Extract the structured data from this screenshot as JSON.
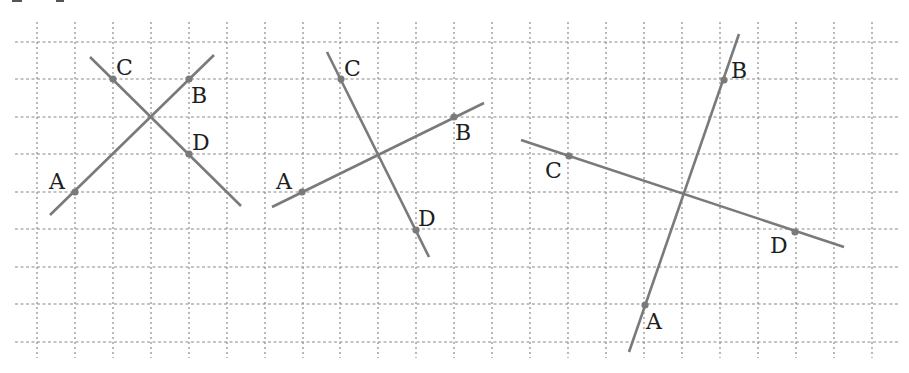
{
  "diagram": {
    "type": "geometry-grid-figures",
    "colors": {
      "background": "#ffffff",
      "grid": "#8a8a8a",
      "lines": "#7a7a7a",
      "labels": "#1e1e1e"
    },
    "grid": {
      "vertical_x": [
        37,
        75,
        113,
        151,
        189,
        227,
        265,
        303,
        340,
        378,
        416,
        454,
        492,
        530,
        568,
        606,
        644,
        682,
        720,
        758,
        796,
        834,
        872
      ],
      "horizontal_y": [
        42,
        79,
        117,
        154,
        192,
        229,
        267,
        304,
        342
      ],
      "x_extent": [
        15,
        898
      ],
      "y_extent": [
        22,
        358
      ]
    },
    "figures": [
      {
        "id": "figure-1",
        "lines": [
          {
            "name": "AB",
            "from": [
              50,
              215
            ],
            "to": [
              214,
              55
            ]
          },
          {
            "name": "CD",
            "from": [
              90,
              57
            ],
            "to": [
              241,
              206
            ]
          }
        ],
        "points": [
          {
            "label": "A",
            "x": 75,
            "y": 192,
            "lx": 49,
            "ly": 189
          },
          {
            "label": "B",
            "x": 189,
            "y": 79,
            "lx": 191,
            "ly": 103
          },
          {
            "label": "C",
            "x": 113,
            "y": 79,
            "lx": 116,
            "ly": 75
          },
          {
            "label": "D",
            "x": 189,
            "y": 154,
            "lx": 192,
            "ly": 150
          }
        ]
      },
      {
        "id": "figure-2",
        "lines": [
          {
            "name": "AB",
            "from": [
              272,
              207
            ],
            "to": [
              484,
              103
            ]
          },
          {
            "name": "CD",
            "from": [
              327,
              52
            ],
            "to": [
              429,
              257
            ]
          }
        ],
        "points": [
          {
            "label": "A",
            "x": 302,
            "y": 192,
            "lx": 276,
            "ly": 189
          },
          {
            "label": "B",
            "x": 454,
            "y": 117,
            "lx": 455,
            "ly": 140
          },
          {
            "label": "C",
            "x": 341,
            "y": 79,
            "lx": 344,
            "ly": 76
          },
          {
            "label": "D",
            "x": 416,
            "y": 230,
            "lx": 418,
            "ly": 226
          }
        ]
      },
      {
        "id": "figure-3",
        "lines": [
          {
            "name": "AB",
            "from": [
              629,
              352
            ],
            "to": [
              739,
              34
            ]
          },
          {
            "name": "CD",
            "from": [
              521,
              140
            ],
            "to": [
              844,
              247
            ]
          }
        ],
        "points": [
          {
            "label": "A",
            "x": 645,
            "y": 305,
            "lx": 646,
            "ly": 329
          },
          {
            "label": "B",
            "x": 724,
            "y": 80,
            "lx": 731,
            "ly": 78
          },
          {
            "label": "C",
            "x": 569,
            "y": 156,
            "lx": 545,
            "ly": 178
          },
          {
            "label": "D",
            "x": 795,
            "y": 232,
            "lx": 770,
            "ly": 253
          }
        ]
      }
    ]
  }
}
